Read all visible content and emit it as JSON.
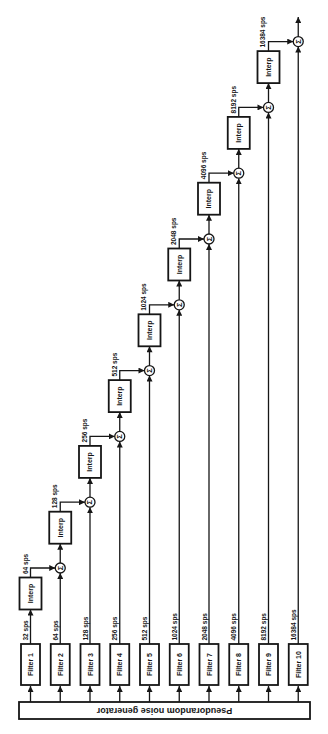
{
  "figure": {
    "background_color": "#ffffff",
    "ink_color": "#161616",
    "noise_generator": {
      "label": "Pseudorandom noise generator"
    },
    "filters": [
      {
        "label": "Filter 1",
        "output_rate": "32 sps"
      },
      {
        "label": "Filter 2",
        "output_rate": "64 sps"
      },
      {
        "label": "Filter 3",
        "output_rate": "128 sps"
      },
      {
        "label": "Filter 4",
        "output_rate": "256 sps"
      },
      {
        "label": "Filter 5",
        "output_rate": "512 sps"
      },
      {
        "label": "Filter 6",
        "output_rate": "1024 sps"
      },
      {
        "label": "Filter 7",
        "output_rate": "2048 sps"
      },
      {
        "label": "Filter 8",
        "output_rate": "4096 sps"
      },
      {
        "label": "Filter 9",
        "output_rate": "8192 sps"
      },
      {
        "label": "Filter 10",
        "output_rate": "16384 sps"
      }
    ],
    "stages": [
      {
        "interp_label": "Interp",
        "sum_symbol": "Σ",
        "output_rate": "64 sps"
      },
      {
        "interp_label": "Interp",
        "sum_symbol": "Σ",
        "output_rate": "128 sps"
      },
      {
        "interp_label": "Interp",
        "sum_symbol": "Σ",
        "output_rate": "256 sps"
      },
      {
        "interp_label": "Interp",
        "sum_symbol": "Σ",
        "output_rate": "512 sps"
      },
      {
        "interp_label": "Interp",
        "sum_symbol": "Σ",
        "output_rate": "1024 sps"
      },
      {
        "interp_label": "Interp",
        "sum_symbol": "Σ",
        "output_rate": "2048 sps"
      },
      {
        "interp_label": "Interp",
        "sum_symbol": "Σ",
        "output_rate": "4096 sps"
      },
      {
        "interp_label": "Interp",
        "sum_symbol": "Σ",
        "output_rate": "8192 sps"
      },
      {
        "interp_label": "Interp",
        "sum_symbol": "Σ",
        "output_rate": "16384 sps"
      }
    ]
  }
}
